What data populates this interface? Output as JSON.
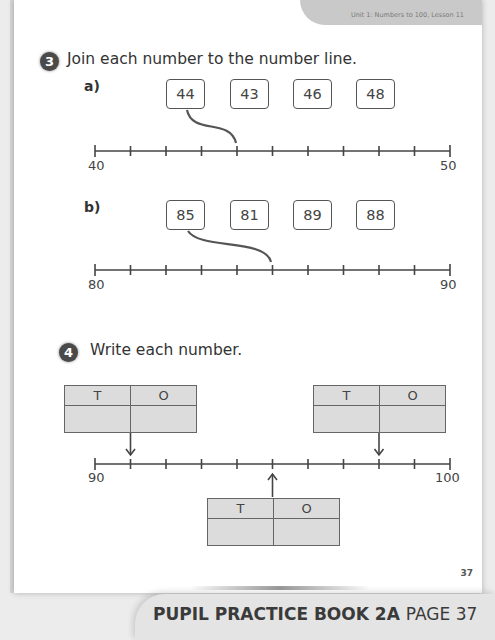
{
  "header": {
    "lesson": "Unit 1: Numbers to 100, Lesson 11"
  },
  "question3": {
    "number": "3",
    "instruction": "Join each number to the number line.",
    "parts": [
      {
        "label": "a)",
        "boxes": [
          "44",
          "43",
          "46",
          "48"
        ],
        "line_start": "40",
        "line_end": "50",
        "example_join": {
          "from": "44",
          "to_tick": 4
        }
      },
      {
        "label": "b)",
        "boxes": [
          "85",
          "81",
          "89",
          "88"
        ],
        "line_start": "80",
        "line_end": "90",
        "example_join": {
          "from": "85",
          "to_tick": 5
        }
      }
    ]
  },
  "question4": {
    "number": "4",
    "instruction": "Write each number.",
    "line_start": "90",
    "line_end": "100",
    "tables": [
      {
        "tens_header": "T",
        "ones_header": "O",
        "points_to_tick": 1
      },
      {
        "tens_header": "T",
        "ones_header": "O",
        "points_to_tick": 8
      },
      {
        "tens_header": "T",
        "ones_header": "O",
        "points_to_tick": 5
      }
    ]
  },
  "footer": {
    "page_number": "37",
    "book_title": "PUPIL PRACTICE BOOK 2A",
    "page_label": "PAGE 37"
  }
}
